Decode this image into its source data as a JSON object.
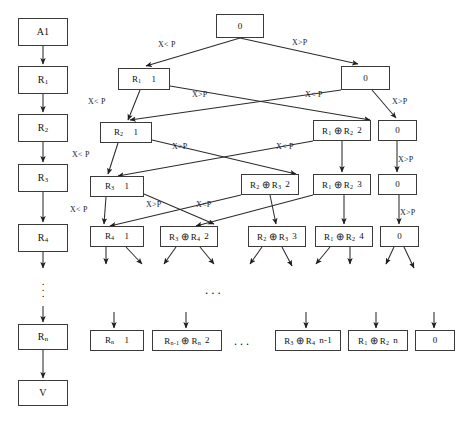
{
  "diagram": {
    "background": "#ffffff",
    "stroke": "#3a3a3a",
    "labels": {
      "less": "X< P",
      "greater": "X>P",
      "ellipsis_h": "...",
      "ellipsis_v": "."
    },
    "chain": [
      {
        "name": "chain-a1",
        "text": "A1",
        "x": 18,
        "y": 18,
        "w": 50,
        "h": 28
      },
      {
        "name": "chain-r1",
        "text": "R1",
        "html": "R<sub>1</sub>",
        "x": 18,
        "y": 66,
        "w": 50,
        "h": 28
      },
      {
        "name": "chain-r2",
        "text": "R2",
        "html": "R<sub>2</sub>",
        "x": 18,
        "y": 114,
        "w": 50,
        "h": 28
      },
      {
        "name": "chain-r3",
        "text": "R3",
        "html": "R<sub>3</sub>",
        "x": 18,
        "y": 164,
        "w": 50,
        "h": 28
      },
      {
        "name": "chain-r4",
        "text": "R4",
        "html": "R<sub>4</sub>",
        "x": 18,
        "y": 224,
        "w": 50,
        "h": 28
      },
      {
        "name": "chain-rn",
        "text": "Rn",
        "html": "R<sub>n</sub>",
        "x": 18,
        "y": 324,
        "w": 50,
        "h": 26
      },
      {
        "name": "chain-v",
        "text": "V",
        "x": 18,
        "y": 380,
        "w": 50,
        "h": 26
      }
    ],
    "tree": {
      "row0": [
        {
          "name": "node-root-0",
          "label": "0",
          "count": "",
          "x": 216,
          "y": 14,
          "w": 48,
          "h": 24
        }
      ],
      "row1": [
        {
          "name": "node-r1-1",
          "label": "R1",
          "html": "R<sub>1</sub>",
          "count": "1",
          "x": 118,
          "y": 68,
          "w": 52,
          "h": 22
        },
        {
          "name": "node-0-r1",
          "label": "0",
          "count": "",
          "x": 341,
          "y": 66,
          "w": 49,
          "h": 24
        }
      ],
      "row2": [
        {
          "name": "node-r2-1",
          "label": "R2",
          "html": "R<sub>2</sub>",
          "count": "1",
          "x": 100,
          "y": 122,
          "w": 52,
          "h": 21
        },
        {
          "name": "node-r1r2-2",
          "label": "R1 ⊕ R2",
          "html": "R<sub>1</sub> <span class=\"op\">⊕</span> R<sub>2</sub>",
          "count": "2",
          "x": 313,
          "y": 120,
          "w": 58,
          "h": 21
        },
        {
          "name": "node-0-r2",
          "label": "0",
          "count": "",
          "x": 378,
          "y": 120,
          "w": 39,
          "h": 21
        }
      ],
      "row3": [
        {
          "name": "node-r3-1",
          "label": "R3",
          "html": "R<sub>3</sub>",
          "count": "1",
          "x": 90,
          "y": 176,
          "w": 54,
          "h": 21
        },
        {
          "name": "node-r2r3-2",
          "label": "R2 ⊕ R3",
          "html": "R<sub>2</sub> <span class=\"op\">⊕</span> R<sub>3</sub>",
          "count": "2",
          "x": 241,
          "y": 174,
          "w": 58,
          "h": 21
        },
        {
          "name": "node-r1r2-3",
          "label": "R1 ⊕ R2",
          "html": "R<sub>1</sub> <span class=\"op\">⊕</span> R<sub>2</sub>",
          "count": "3",
          "x": 313,
          "y": 174,
          "w": 58,
          "h": 21
        },
        {
          "name": "node-0-r3",
          "label": "0",
          "count": "",
          "x": 378,
          "y": 174,
          "w": 39,
          "h": 21
        }
      ],
      "row4": [
        {
          "name": "node-r4-1",
          "label": "R4",
          "html": "R<sub>4</sub>",
          "count": "1",
          "x": 90,
          "y": 226,
          "w": 54,
          "h": 21
        },
        {
          "name": "node-r3r4-2",
          "label": "R3 ⊕ R4",
          "html": "R<sub>3</sub> <span class=\"op\">⊕</span> R<sub>4</sub>",
          "count": "2",
          "x": 160,
          "y": 226,
          "w": 58,
          "h": 21
        },
        {
          "name": "node-r2r3-3",
          "label": "R2 ⊕ R3",
          "html": "R<sub>2</sub> <span class=\"op\">⊕</span> R<sub>3</sub>",
          "count": "3",
          "x": 248,
          "y": 226,
          "w": 58,
          "h": 21
        },
        {
          "name": "node-r1r2-4",
          "label": "R1 ⊕ R2",
          "html": "R<sub>1</sub> <span class=\"op\">⊕</span> R<sub>2</sub>",
          "count": "4",
          "x": 315,
          "y": 226,
          "w": 58,
          "h": 21
        },
        {
          "name": "node-0-r4",
          "label": "0",
          "count": "",
          "x": 380,
          "y": 226,
          "w": 39,
          "h": 21
        }
      ],
      "rowN": [
        {
          "name": "node-rn-1",
          "label": "Rn",
          "html": "R<sub>n</sub>",
          "count": "1",
          "x": 90,
          "y": 330,
          "w": 54,
          "h": 21
        },
        {
          "name": "node-rn1rn-2",
          "label": "Rn-1 ⊕ Rn",
          "html": "R<sub>n-1</sub> <span class=\"op\">⊕</span> R<sub>n</sub>",
          "count": "2",
          "x": 152,
          "y": 330,
          "w": 70,
          "h": 21
        },
        {
          "name": "node-r3r4-n1",
          "label": "R3 ⊕ R4 n-1",
          "html": "R<sub>3</sub> <span class=\"op\">⊕</span> R<sub>4</sub>",
          "count": "n-1",
          "x": 275,
          "y": 330,
          "w": 66,
          "h": 21
        },
        {
          "name": "node-r1r2-n",
          "label": "R1 ⊕ R2 n",
          "html": "R<sub>1</sub> <span class=\"op\">⊕</span> R<sub>2</sub>",
          "count": "n",
          "x": 348,
          "y": 330,
          "w": 60,
          "h": 21
        },
        {
          "name": "node-0-rn",
          "label": "0",
          "count": "",
          "x": 415,
          "y": 330,
          "w": 40,
          "h": 21
        }
      ]
    },
    "edge_labels": [
      {
        "name": "edge-label-root-left",
        "text": "X< P",
        "x": 158,
        "y": 40
      },
      {
        "name": "edge-label-root-right",
        "text": "X>P",
        "x": 292,
        "y": 38
      },
      {
        "name": "edge-label-r1-left",
        "text": "X< P",
        "x": 88,
        "y": 97
      },
      {
        "name": "edge-label-r1-right",
        "text": "X>P",
        "x": 192,
        "y": 90
      },
      {
        "name": "edge-label-0r1-left",
        "text": "X< P",
        "x": 308,
        "y": 90
      },
      {
        "name": "edge-label-0r1-right",
        "text": "X>P",
        "x": 392,
        "y": 97
      },
      {
        "name": "edge-label-r2-left",
        "text": "X< P",
        "x": 72,
        "y": 150
      },
      {
        "name": "edge-label-r2-right",
        "text": "X>P",
        "x": 172,
        "y": 142
      },
      {
        "name": "edge-label-mid-left",
        "text": "X< P",
        "x": 278,
        "y": 142
      },
      {
        "name": "edge-label-0r2-right",
        "text": "X>P",
        "x": 398,
        "y": 155
      },
      {
        "name": "edge-label-r3-left",
        "text": "X< P",
        "x": 70,
        "y": 205
      },
      {
        "name": "edge-label-r3-right",
        "text": "X>P",
        "x": 146,
        "y": 200
      },
      {
        "name": "edge-label-mid2-left",
        "text": "X<P",
        "x": 196,
        "y": 200
      },
      {
        "name": "edge-label-0r3-right",
        "text": "X>P",
        "x": 400,
        "y": 208
      }
    ]
  }
}
